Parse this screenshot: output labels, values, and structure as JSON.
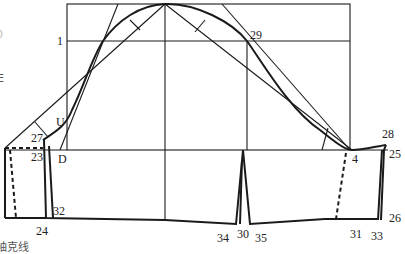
{
  "diagram": {
    "labels": [
      {
        "id": "1",
        "text": "1",
        "x": 57,
        "y": 35
      },
      {
        "id": "29",
        "text": "29",
        "x": 250,
        "y": 30
      },
      {
        "id": "U",
        "text": "U",
        "x": 56,
        "y": 116
      },
      {
        "id": "27",
        "text": "27",
        "x": 31,
        "y": 132
      },
      {
        "id": "23",
        "text": "23",
        "x": 31,
        "y": 151
      },
      {
        "id": "D",
        "text": "D",
        "x": 58,
        "y": 153
      },
      {
        "id": "32",
        "text": "32",
        "x": 53,
        "y": 205
      },
      {
        "id": "24",
        "text": "24",
        "x": 36,
        "y": 225
      },
      {
        "id": "34",
        "text": "34",
        "x": 217,
        "y": 232
      },
      {
        "id": "30",
        "text": "30",
        "x": 238,
        "y": 228
      },
      {
        "id": "35",
        "text": "35",
        "x": 256,
        "y": 232
      },
      {
        "id": "4",
        "text": "4",
        "x": 349,
        "y": 153
      },
      {
        "id": "28",
        "text": "28",
        "x": 382,
        "y": 128
      },
      {
        "id": "25",
        "text": "25",
        "x": 388,
        "y": 148
      },
      {
        "id": "26",
        "text": "26",
        "x": 388,
        "y": 212
      },
      {
        "id": "31",
        "text": "31",
        "x": 350,
        "y": 228
      },
      {
        "id": "33",
        "text": "33",
        "x": 371,
        "y": 230
      }
    ],
    "side_text": [
      {
        "text": "0",
        "x": 1,
        "y": 28
      },
      {
        "text": "E",
        "x": 0,
        "y": 74
      },
      {
        "text": "袖克线",
        "x": 0,
        "y": 238
      }
    ],
    "colors": {
      "line": "#1a1a1a",
      "background": "#ffffff"
    }
  }
}
